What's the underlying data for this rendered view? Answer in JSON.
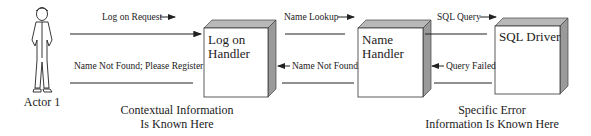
{
  "actor": {
    "label": "Actor 1"
  },
  "components": [
    {
      "id": "logon",
      "lines": [
        "Log on",
        "Handler"
      ]
    },
    {
      "id": "name",
      "lines": [
        "Name",
        "Handler"
      ]
    },
    {
      "id": "sql",
      "lines": [
        "SQL Driver"
      ]
    }
  ],
  "messages": {
    "logon_request": "Log on Request",
    "name_not_found_register": "Name Not Found; Please Register",
    "name_lookup": "Name Lookup",
    "name_not_found": "Name Not Found",
    "sql_query": "SQL Query",
    "query_failed": "Query Failed"
  },
  "notes": {
    "contextual": [
      "Contextual Information",
      "Is Known Here"
    ],
    "specific": [
      "Specific Error",
      "Information Is Known Here"
    ]
  },
  "colors": {
    "line": "#222222",
    "box_front": "#ffffff",
    "box_top": "#b8b8b8",
    "box_side": "#9a9a9a"
  }
}
